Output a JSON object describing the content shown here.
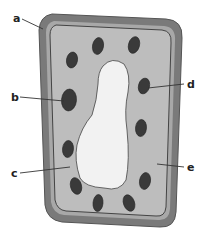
{
  "diagram": {
    "labels": [
      {
        "id": "a",
        "text": "a",
        "x": 13,
        "y": 22,
        "line": [
          22,
          19,
          43,
          29
        ]
      },
      {
        "id": "b",
        "text": "b",
        "x": 11,
        "y": 101,
        "line": [
          20,
          97,
          64,
          101
        ]
      },
      {
        "id": "c",
        "text": "c",
        "x": 11,
        "y": 177,
        "line": [
          20,
          173,
          70,
          167
        ]
      },
      {
        "id": "d",
        "text": "d",
        "x": 187,
        "y": 88,
        "line": [
          184,
          84,
          148,
          88
        ]
      },
      {
        "id": "e",
        "text": "e",
        "x": 187,
        "y": 171,
        "line": [
          184,
          167,
          157,
          164
        ]
      }
    ],
    "colors": {
      "cell_wall": "#7a7a7a",
      "cell_wall_edge": "#555555",
      "membrane_gap": "#b4b4b4",
      "cytoplasm": "#bdbdbd",
      "vacuole": "#f2f2f2",
      "chloroplast": "#3a3a3a",
      "label": "#222222"
    }
  }
}
